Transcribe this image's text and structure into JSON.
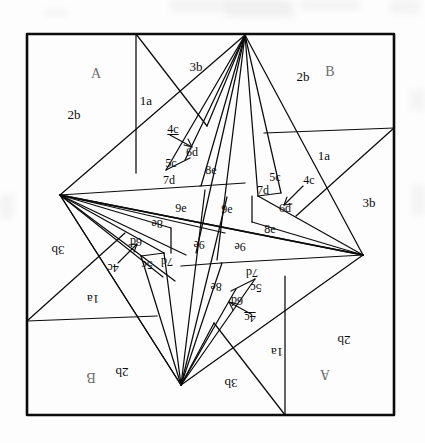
{
  "figure": {
    "colors": {
      "ink": "#0b0b0b",
      "paper": "#fdfdfd",
      "caption_ink": "#6d6d6d",
      "texture": "#ececec"
    },
    "frame": {
      "x": 27,
      "y": 34,
      "width": 367,
      "height": 381,
      "stroke_width": 2.6
    },
    "apex_points": {
      "top": [
        245,
        35
      ],
      "left": [
        60,
        195
      ],
      "right": [
        363,
        255
      ],
      "bottom": [
        181,
        385
      ]
    }
  },
  "labels": [
    {
      "id": "A-top",
      "text": "A",
      "x": 96,
      "y": 74,
      "size": "cap",
      "rot": "up"
    },
    {
      "id": "B-top",
      "text": "B",
      "x": 330,
      "y": 72,
      "size": "cap",
      "rot": "up"
    },
    {
      "id": "2b-topleft",
      "text": "2b",
      "x": 74,
      "y": 114,
      "size": "big",
      "rot": "up"
    },
    {
      "id": "1a-topleft",
      "text": "1a",
      "x": 146,
      "y": 100,
      "size": "big",
      "rot": "up"
    },
    {
      "id": "3b-top",
      "text": "3b",
      "x": 196,
      "y": 66,
      "size": "big",
      "rot": "up"
    },
    {
      "id": "2b-topright",
      "text": "2b",
      "x": 303,
      "y": 76,
      "size": "big",
      "rot": "up"
    },
    {
      "id": "1a-right",
      "text": "1a",
      "x": 324,
      "y": 155,
      "size": "big",
      "rot": "up"
    },
    {
      "id": "3b-right",
      "text": "3b",
      "x": 369,
      "y": 202,
      "size": "big",
      "rot": "up"
    },
    {
      "id": "4c-upper",
      "text": "4c",
      "x": 173,
      "y": 129,
      "size": "med",
      "rot": "up",
      "underline": true
    },
    {
      "id": "6d-upper",
      "text": "6d",
      "x": 192,
      "y": 152,
      "size": "med",
      "rot": "up"
    },
    {
      "id": "5c-upper",
      "text": "5c",
      "x": 171,
      "y": 163,
      "size": "med",
      "rot": "up"
    },
    {
      "id": "7d-upper",
      "text": "7d",
      "x": 169,
      "y": 180,
      "size": "med",
      "rot": "up"
    },
    {
      "id": "8e-upper",
      "text": "8e",
      "x": 211,
      "y": 170,
      "size": "med",
      "rot": "up"
    },
    {
      "id": "9e-upperleft",
      "text": "9e",
      "x": 181,
      "y": 208,
      "size": "med",
      "rot": "up"
    },
    {
      "id": "9e-uppermid",
      "text": "9e",
      "x": 227,
      "y": 209,
      "size": "med",
      "rot": "up"
    },
    {
      "id": "5c-right",
      "text": "5c",
      "x": 275,
      "y": 177,
      "size": "med",
      "rot": "up"
    },
    {
      "id": "4c-right",
      "text": "4c",
      "x": 309,
      "y": 180,
      "size": "med",
      "rot": "up"
    },
    {
      "id": "7d-right",
      "text": "7d",
      "x": 263,
      "y": 190,
      "size": "med",
      "rot": "up"
    },
    {
      "id": "6d-right",
      "text": "6d",
      "x": 285,
      "y": 208,
      "size": "med",
      "rot": "up"
    },
    {
      "id": "8e-right",
      "text": "8e",
      "x": 270,
      "y": 229,
      "size": "med",
      "rot": "up"
    },
    {
      "id": "8e-left-rot",
      "text": "8e",
      "x": 157,
      "y": 224,
      "size": "med",
      "rot": "down"
    },
    {
      "id": "6d-left-rot",
      "text": "6d",
      "x": 136,
      "y": 242,
      "size": "med",
      "rot": "down"
    },
    {
      "id": "7d-left-rot",
      "text": "7d",
      "x": 167,
      "y": 262,
      "size": "med",
      "rot": "down"
    },
    {
      "id": "5c-left-rot",
      "text": "5c",
      "x": 147,
      "y": 265,
      "size": "med",
      "rot": "down"
    },
    {
      "id": "4c-left-rot",
      "text": "4c",
      "x": 113,
      "y": 268,
      "size": "med",
      "rot": "down"
    },
    {
      "id": "9e-lowerleft",
      "text": "9e",
      "x": 199,
      "y": 245,
      "size": "med",
      "rot": "down"
    },
    {
      "id": "9e-lowermid",
      "text": "9e",
      "x": 240,
      "y": 247,
      "size": "med",
      "rot": "down"
    },
    {
      "id": "8e-lower-rot",
      "text": "8e",
      "x": 216,
      "y": 287,
      "size": "med",
      "rot": "down"
    },
    {
      "id": "7d-lower-rot",
      "text": "7d",
      "x": 252,
      "y": 273,
      "size": "med",
      "rot": "down"
    },
    {
      "id": "5c-lower-rot",
      "text": "5c",
      "x": 256,
      "y": 288,
      "size": "med",
      "rot": "down"
    },
    {
      "id": "6d-lower-rot",
      "text": "6d",
      "x": 237,
      "y": 301,
      "size": "med",
      "rot": "down"
    },
    {
      "id": "4c-lower-rot",
      "text": "4c",
      "x": 250,
      "y": 318,
      "size": "med",
      "rot": "down",
      "underline": true
    },
    {
      "id": "3b-left-rot",
      "text": "3b",
      "x": 58,
      "y": 250,
      "size": "big",
      "rot": "down"
    },
    {
      "id": "1a-left-rot",
      "text": "1a",
      "x": 93,
      "y": 299,
      "size": "big",
      "rot": "down"
    },
    {
      "id": "2b-bottomleft",
      "text": "2b",
      "x": 122,
      "y": 372,
      "size": "big",
      "rot": "down"
    },
    {
      "id": "B-bottom",
      "text": "B",
      "x": 91,
      "y": 377,
      "size": "cap",
      "rot": "down"
    },
    {
      "id": "3b-bottom",
      "text": "3b",
      "x": 231,
      "y": 383,
      "size": "big",
      "rot": "down"
    },
    {
      "id": "1a-bottom",
      "text": "1a",
      "x": 277,
      "y": 352,
      "size": "big",
      "rot": "down"
    },
    {
      "id": "2b-bottomright",
      "text": "2b",
      "x": 344,
      "y": 340,
      "size": "big",
      "rot": "down"
    },
    {
      "id": "A-bottom",
      "text": "A",
      "x": 325,
      "y": 374,
      "size": "cap",
      "rot": "down"
    }
  ],
  "texture_blotches": [
    {
      "x": 170,
      "y": 0,
      "w": 120,
      "h": 12
    },
    {
      "x": 225,
      "y": 2,
      "w": 70,
      "h": 16
    },
    {
      "x": 300,
      "y": 0,
      "w": 60,
      "h": 10
    },
    {
      "x": 390,
      "y": 0,
      "w": 30,
      "h": 14
    },
    {
      "x": 45,
      "y": 10,
      "w": 22,
      "h": 6
    },
    {
      "x": 0,
      "y": 195,
      "w": 14,
      "h": 24
    },
    {
      "x": 412,
      "y": 185,
      "w": 13,
      "h": 30
    },
    {
      "x": 410,
      "y": 90,
      "w": 15,
      "h": 20
    }
  ]
}
